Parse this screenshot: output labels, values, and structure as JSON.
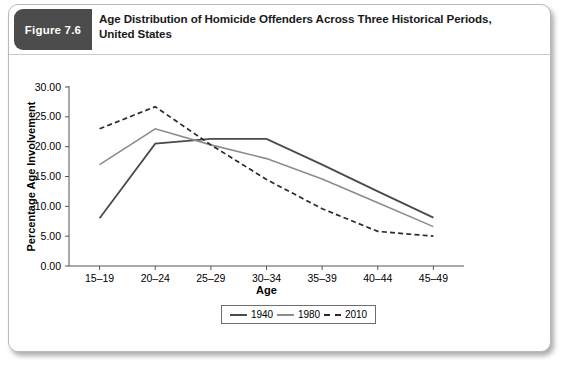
{
  "figure": {
    "badge": "Figure 7.6",
    "title": "Age Distribution of Homicide Offenders Across Three Historical Periods, United States",
    "title_line1": "Age Distribution of Homicide Offenders Across Three Historical Periods,",
    "title_line2": "United States",
    "badge_color": "#4c4c4c"
  },
  "chart_data": {
    "type": "line",
    "title": "",
    "xlabel": "Age",
    "ylabel": "Percentage Age Involvement",
    "categories": [
      "15–19",
      "20–24",
      "25–29",
      "30–34",
      "35–39",
      "40–44",
      "45–49"
    ],
    "ylim": [
      0,
      30
    ],
    "yticks": [
      0,
      5,
      10,
      15,
      20,
      25,
      30
    ],
    "ytick_labels": [
      "0.00",
      "5.00",
      "10.00",
      "15.00",
      "20.00",
      "25.00",
      "30.00"
    ],
    "grid": false,
    "legend_position": "bottom",
    "series": [
      {
        "name": "1940",
        "values": [
          8.0,
          20.5,
          21.3,
          21.3,
          17.0,
          12.5,
          8.1
        ],
        "color": "#4a4a4a",
        "style": "solid",
        "width": 1.8
      },
      {
        "name": "1980",
        "values": [
          17.0,
          23.0,
          20.3,
          18.0,
          14.6,
          10.6,
          6.6
        ],
        "color": "#8c8c8c",
        "style": "solid",
        "width": 1.6
      },
      {
        "name": "2010",
        "values": [
          23.0,
          26.7,
          20.3,
          14.5,
          9.6,
          5.8,
          5.0
        ],
        "color": "#2b2b2b",
        "style": "dashed",
        "width": 1.7
      }
    ]
  },
  "legend": {
    "items": [
      {
        "label": "1940"
      },
      {
        "label": "1980"
      },
      {
        "label": "2010"
      }
    ]
  }
}
